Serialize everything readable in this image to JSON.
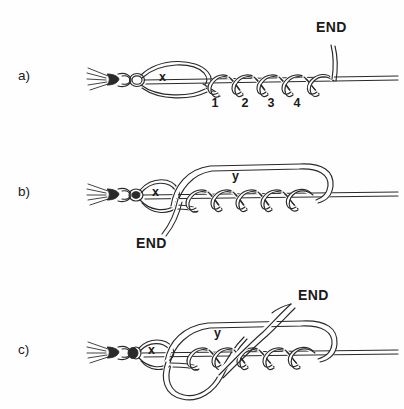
{
  "figure": {
    "background_color": "#fefefe",
    "ink_color": "#2a2a2a",
    "width": 404,
    "height": 409
  },
  "panels": [
    {
      "id": "a",
      "label": "a)",
      "label_x": 18,
      "label_y": 80,
      "description": "Tag end wrapped four times around standing line above the hook eye, forming loop x",
      "labels": {
        "loop": "x",
        "loop_x": 159,
        "loop_y": 81,
        "end": "END",
        "end_x": 316,
        "end_y": 32
      },
      "wrap_numbers": [
        "1",
        "2",
        "3",
        "4"
      ],
      "wrap_number_positions": [
        {
          "x": 215,
          "y": 107
        },
        {
          "x": 245,
          "y": 107
        },
        {
          "x": 271,
          "y": 107
        },
        {
          "x": 297,
          "y": 107
        }
      ]
    },
    {
      "id": "b",
      "label": "b)",
      "label_x": 18,
      "label_y": 196,
      "description": "Tag end passed back through loop x, creating a large overlying loop y",
      "labels": {
        "loop_x": "x",
        "loop_x_x": 152,
        "loop_x_y": 196,
        "loop_y": "y",
        "loop_y_x": 232,
        "loop_y_y": 180,
        "end": "END",
        "end_x": 148,
        "end_y": 243
      }
    },
    {
      "id": "c",
      "label": "c)",
      "label_x": 18,
      "label_y": 354,
      "description": "Loop y drawn over the wraps and the tag end pulled up and away to tighten",
      "labels": {
        "loop_x": "x",
        "loop_x_x": 150,
        "loop_x_y": 354,
        "loop_y": "y",
        "loop_y_x": 218,
        "loop_y_y": 335,
        "end": "END",
        "end_x": 298,
        "end_y": 300
      }
    }
  ]
}
